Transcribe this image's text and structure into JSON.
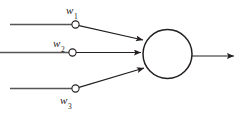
{
  "figure": {
    "background_color": "#ffffff",
    "stroke_color": "#231f20",
    "text_color": "#1a1a1a"
  },
  "labels": {
    "weight_1": {
      "symbol": "w",
      "subscript": "1",
      "text": "w1"
    },
    "weight_2": {
      "symbol": "w",
      "subscript": "2",
      "text": "w2"
    },
    "weight_3": {
      "symbol": "w",
      "subscript": "3",
      "text": "w3"
    }
  },
  "geometry": {
    "soma": {
      "cx": 167.5,
      "cy": 54,
      "r": 24.5
    },
    "weight_nodes": [
      {
        "name": "weight-node-1",
        "cx": 75.5,
        "cy": 24.5,
        "r": 3.6
      },
      {
        "name": "weight-node-2",
        "cx": 72.5,
        "cy": 52.5,
        "r": 3.6
      },
      {
        "name": "weight-node-3",
        "cx": 75.5,
        "cy": 88.5,
        "r": 3.6
      }
    ],
    "input_lines": [
      {
        "name": "input-line-1",
        "x1": 10,
        "y1": 24.5,
        "x2": 72,
        "y2": 24.5
      },
      {
        "name": "input-line-2",
        "x1": 0,
        "y1": 52.5,
        "x2": 69,
        "y2": 52.5
      },
      {
        "name": "input-line-3",
        "x1": 10,
        "y1": 88.5,
        "x2": 72,
        "y2": 88.5
      }
    ],
    "dendrite_arrows": [
      {
        "name": "dendrite-arrow-1",
        "x1": 79,
        "y1": 25.5,
        "x2": 144,
        "y2": 40
      },
      {
        "name": "dendrite-arrow-2",
        "x1": 76,
        "y1": 52.5,
        "x2": 142,
        "y2": 52.5
      },
      {
        "name": "dendrite-arrow-3",
        "x1": 79,
        "y1": 87.5,
        "x2": 145,
        "y2": 68
      }
    ],
    "output_arrow": {
      "name": "axon-output-arrow",
      "x1": 192,
      "y1": 56,
      "x2": 236,
      "y2": 56
    }
  }
}
